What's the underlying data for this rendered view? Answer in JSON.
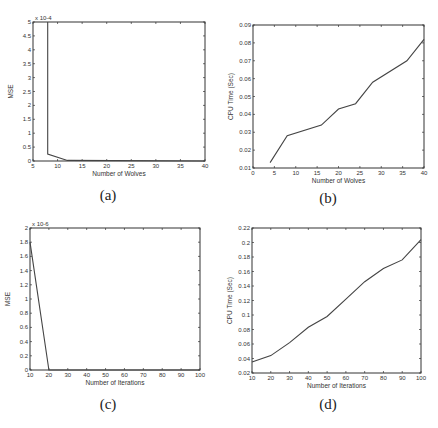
{
  "chart_data": [
    {
      "id": "a",
      "type": "line",
      "caption": "(a)",
      "title": "",
      "xlabel": "Number of Wolves",
      "ylabel": "MSE",
      "y_multiplier": "x 10^-4",
      "xlim": [
        5,
        40
      ],
      "ylim": [
        0,
        5
      ],
      "xticks": [
        5,
        10,
        15,
        20,
        25,
        30,
        35,
        40
      ],
      "yticks": [
        0,
        0.5,
        1,
        1.5,
        2,
        2.5,
        3,
        3.5,
        4,
        4.5,
        5
      ],
      "x": [
        8,
        8,
        12,
        40
      ],
      "values": [
        5.0,
        0.25,
        0.02,
        0.0
      ]
    },
    {
      "id": "b",
      "type": "line",
      "caption": "(b)",
      "title": "",
      "xlabel": "Number of Wolves",
      "ylabel": "CPU Time (Sec)",
      "xlim": [
        0,
        40
      ],
      "ylim": [
        0.01,
        0.09
      ],
      "xticks": [
        0,
        5,
        10,
        15,
        20,
        25,
        30,
        35,
        40
      ],
      "yticks": [
        0.01,
        0.02,
        0.03,
        0.04,
        0.05,
        0.06,
        0.07,
        0.08,
        0.09
      ],
      "x": [
        4,
        8,
        16,
        20,
        24,
        28,
        36,
        40
      ],
      "values": [
        0.013,
        0.028,
        0.034,
        0.043,
        0.046,
        0.058,
        0.07,
        0.082
      ]
    },
    {
      "id": "c",
      "type": "line",
      "caption": "(c)",
      "title": "",
      "xlabel": "Number of Iterations",
      "ylabel": "MSE",
      "y_multiplier": "x 10^-6",
      "xlim": [
        10,
        100
      ],
      "ylim": [
        0,
        2
      ],
      "xticks": [
        10,
        20,
        30,
        40,
        50,
        60,
        70,
        80,
        90,
        100
      ],
      "yticks": [
        0,
        0.2,
        0.4,
        0.6,
        0.8,
        1,
        1.2,
        1.4,
        1.6,
        1.8,
        2
      ],
      "x": [
        10,
        20,
        100
      ],
      "values": [
        1.8,
        0.0,
        0.0
      ]
    },
    {
      "id": "d",
      "type": "line",
      "caption": "(d)",
      "title": "",
      "xlabel": "Number of Iterations",
      "ylabel": "CPU Time (Sec)",
      "xlim": [
        10,
        100
      ],
      "ylim": [
        0.02,
        0.22
      ],
      "xticks": [
        10,
        20,
        30,
        40,
        50,
        60,
        70,
        80,
        90,
        100
      ],
      "yticks": [
        0.02,
        0.04,
        0.06,
        0.08,
        0.1,
        0.12,
        0.14,
        0.16,
        0.18,
        0.2,
        0.22
      ],
      "x": [
        10,
        20,
        30,
        40,
        50,
        60,
        70,
        80,
        90,
        100
      ],
      "values": [
        0.035,
        0.044,
        0.062,
        0.083,
        0.098,
        0.122,
        0.146,
        0.164,
        0.176,
        0.204
      ]
    }
  ],
  "captions": {
    "a": "(a)",
    "b": "(b)",
    "c": "(c)",
    "d": "(d)"
  },
  "figure_label_partial": "Fig"
}
